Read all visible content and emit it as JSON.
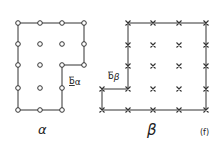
{
  "figure": {
    "panel_label": "(f)",
    "alpha": {
      "symbol": "α",
      "burgers_label": "b",
      "burgers_sub": "α",
      "marker": "circle"
    },
    "beta": {
      "symbol": "β",
      "burgers_label": "b",
      "burgers_sub": "β",
      "marker": "cross"
    }
  },
  "colors": {
    "ink": "#222222"
  }
}
